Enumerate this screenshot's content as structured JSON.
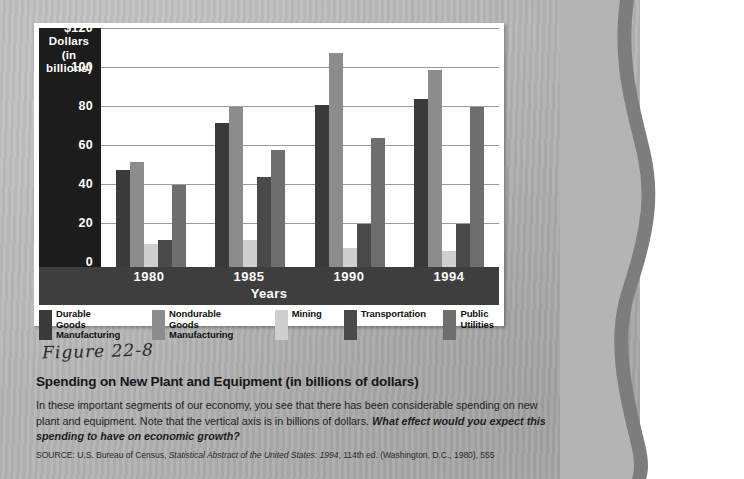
{
  "chart_data": {
    "type": "bar",
    "title": "Spending on New Plant and Equipment (in billions of dollars)",
    "xlabel": "Years",
    "ylabel": "Dollars (in billions)",
    "ylim": [
      0,
      120
    ],
    "yticks": [
      "$120",
      "100",
      "80",
      "60",
      "40",
      "20",
      "0"
    ],
    "ytick_values": [
      120,
      100,
      80,
      60,
      40,
      20,
      0
    ],
    "grid": true,
    "legend_position": "bottom",
    "categories": [
      "1980",
      "1985",
      "1990",
      "1994"
    ],
    "series": [
      {
        "name": "Durable Goods Manufacturing",
        "color": "#3a3a3a",
        "values": [
          50,
          74,
          83,
          86
        ]
      },
      {
        "name": "Nondurable Goods Manufacturing",
        "color": "#8c8c8c",
        "values": [
          54,
          82,
          110,
          101
        ]
      },
      {
        "name": "Mining",
        "color": "#cfcfcf",
        "values": [
          12,
          14,
          10,
          8
        ]
      },
      {
        "name": "Transportation",
        "color": "#4a4a4a",
        "values": [
          14,
          46,
          22,
          22
        ]
      },
      {
        "name": "Public Utilities",
        "color": "#6e6e6e",
        "values": [
          42,
          60,
          66,
          82
        ]
      }
    ]
  },
  "y_axis": {
    "title_line1": "Dollars",
    "title_line2": "(in",
    "title_line3": "billions)"
  },
  "x_axis": {
    "label": "Years",
    "ticks": [
      "1980",
      "1985",
      "1990",
      "1994"
    ]
  },
  "legend": {
    "items": [
      {
        "label": "Durable\nGoods\nManufacturing",
        "color": "#3a3a3a"
      },
      {
        "label": "Nondurable\nGoods\nManufacturing",
        "color": "#8c8c8c"
      },
      {
        "label": "Mining",
        "color": "#cfcfcf"
      },
      {
        "label": "Transportation",
        "color": "#4a4a4a"
      },
      {
        "label": "Public\nUtilities",
        "color": "#6e6e6e"
      }
    ]
  },
  "caption": {
    "handwritten_figure": "Figure 22-8",
    "title": "Spending on New Plant and Equipment (in billions of dollars)",
    "body_plain": "In these important segments of our economy, you see that there has been considerable spending on new plant and equipment. Note that the vertical axis is in billions of dollars. ",
    "body_question": "What effect would you expect this spending to have on economic growth?",
    "source_prefix": "SOURCE: U.S. Bureau of Census, ",
    "source_italic": "Statistical Abstract of the United States: 1994",
    "source_suffix": ", 114th ed. (Washington, D.C., 1980), 555"
  },
  "page": {
    "sheet_color": "#b4b4b4",
    "background_color": "#ffffff"
  }
}
